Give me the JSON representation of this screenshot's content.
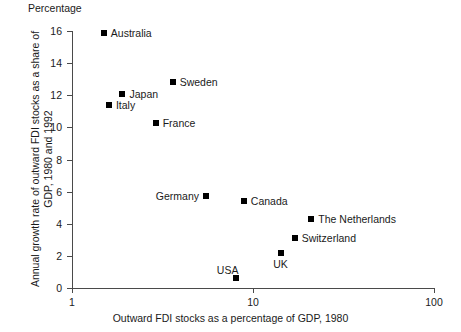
{
  "chart_data": {
    "type": "scatter",
    "title": "",
    "unit_caption": "Percentage",
    "xlabel": "Outward FDI stocks as a percentage of GDP, 1980",
    "ylabel_line1": "Annual growth rate of outward FDI stocks as a share of",
    "ylabel_line2": "GDP, 1980 and 1992",
    "x_scale": "log",
    "xlim": [
      1,
      100
    ],
    "ylim": [
      0,
      16
    ],
    "xticks": [
      "1",
      "10",
      "100"
    ],
    "xtick_values": [
      1,
      10,
      100
    ],
    "yticks": [
      "0",
      "2",
      "4",
      "6",
      "8",
      "10",
      "12",
      "14",
      "16"
    ],
    "ytick_values": [
      0,
      2,
      4,
      6,
      8,
      10,
      12,
      14,
      16
    ],
    "grid": false,
    "legend": "none",
    "marker_color": "#000000",
    "axis_color": "#4a4a4a",
    "points": [
      {
        "name": "Australia",
        "x": 1.5,
        "y": 15.9,
        "label_pos": "right"
      },
      {
        "name": "Sweden",
        "x": 3.6,
        "y": 12.8,
        "label_pos": "right"
      },
      {
        "name": "Japan",
        "x": 1.9,
        "y": 12.1,
        "label_pos": "right"
      },
      {
        "name": "Italy",
        "x": 1.6,
        "y": 11.4,
        "label_pos": "right"
      },
      {
        "name": "France",
        "x": 2.9,
        "y": 10.3,
        "label_pos": "right"
      },
      {
        "name": "Germany",
        "x": 5.5,
        "y": 5.7,
        "label_pos": "left"
      },
      {
        "name": "Canada",
        "x": 8.9,
        "y": 5.4,
        "label_pos": "right"
      },
      {
        "name": "The Netherlands",
        "x": 21.0,
        "y": 4.3,
        "label_pos": "right"
      },
      {
        "name": "Switzerland",
        "x": 17.0,
        "y": 3.1,
        "label_pos": "right"
      },
      {
        "name": "UK",
        "x": 14.2,
        "y": 2.2,
        "label_pos": "below"
      },
      {
        "name": "USA",
        "x": 8.1,
        "y": 0.6,
        "label_pos": "above-left"
      }
    ]
  }
}
